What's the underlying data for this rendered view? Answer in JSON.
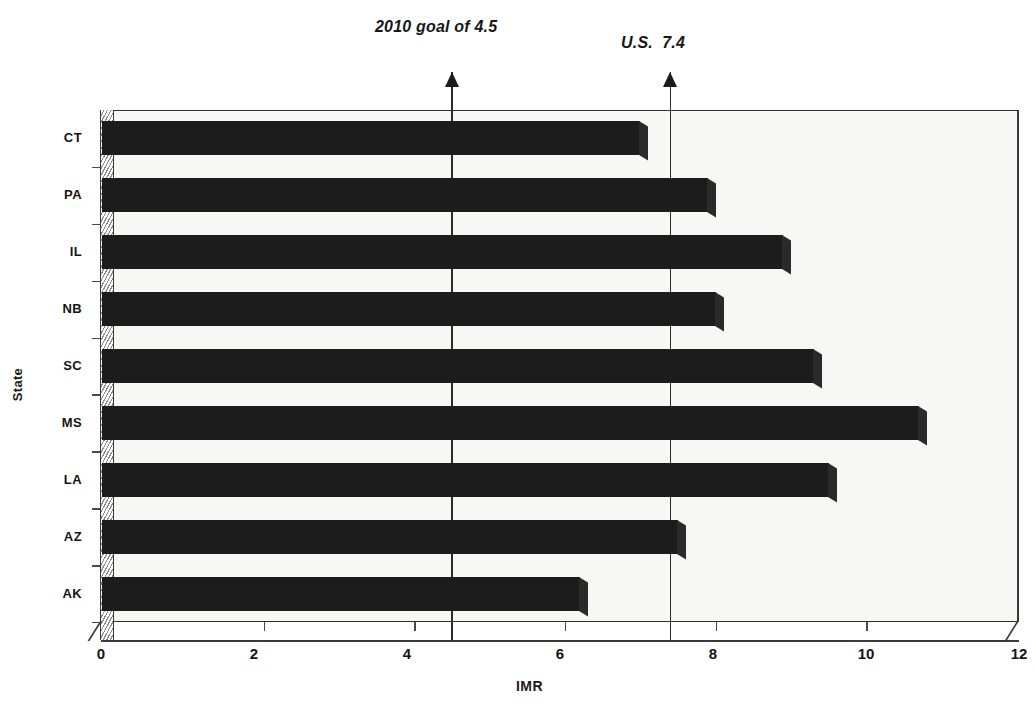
{
  "chart_data": {
    "type": "bar",
    "orientation": "horizontal",
    "title": "",
    "xlabel": "IMR",
    "ylabel": "State",
    "categories": [
      "CT",
      "PA",
      "IL",
      "NB",
      "SC",
      "MS",
      "LA",
      "AZ",
      "AK"
    ],
    "values": [
      7.0,
      7.9,
      8.9,
      8.0,
      9.3,
      10.7,
      9.5,
      7.5,
      6.2
    ],
    "xlim": [
      0,
      12
    ],
    "xticks": [
      0,
      2,
      4,
      6,
      8,
      10,
      12
    ],
    "xtick_labels": [
      "0",
      "2",
      "4",
      "6",
      "8",
      "10",
      "12"
    ],
    "grid": false,
    "legend": null,
    "bar_color": "#1c1c1c",
    "plot_background": "#f7f7f5",
    "annotations": [
      {
        "id": "goal",
        "label": "2010 goal of 4.5",
        "value": 4.5,
        "style": "arrow-up"
      },
      {
        "id": "us",
        "label": "U.S.  7.4",
        "value": 7.4,
        "style": "arrow-up"
      }
    ]
  },
  "annotations": {
    "goal_label": "2010 goal of 4.5",
    "us_label": "U.S.  7.4"
  },
  "axes": {
    "x_title": "IMR",
    "y_title": "State"
  }
}
